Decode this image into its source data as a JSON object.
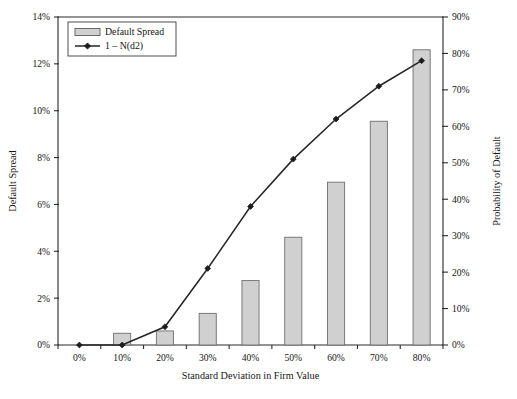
{
  "chart_data": {
    "type": "bar",
    "title": "",
    "subtitle": "",
    "xlabel": "Standard Deviation in Firm Value",
    "ylabel": "Default Spread",
    "y2label": "Probability of Default",
    "categories": [
      "0%",
      "10%",
      "20%",
      "30%",
      "40%",
      "50%",
      "60%",
      "70%",
      "80%"
    ],
    "x_tick_labels": [
      "0%",
      "10%",
      "20%",
      "30%",
      "40%",
      "50%",
      "60%",
      "70%",
      "80%"
    ],
    "y_tick_labels": [
      "0%",
      "2%",
      "4%",
      "6%",
      "8%",
      "10%",
      "12%",
      "14%"
    ],
    "y2_tick_labels": [
      "0%",
      "10%",
      "20%",
      "30%",
      "40%",
      "50%",
      "60%",
      "70%",
      "80%",
      "90%"
    ],
    "ylim": [
      0,
      14
    ],
    "y2lim": [
      0,
      90
    ],
    "grid": false,
    "legend_position": "top-left",
    "series": [
      {
        "name": "Default Spread",
        "type": "bar",
        "axis": "left",
        "values": [
          0,
          0.5,
          0.6,
          1.35,
          2.75,
          4.6,
          6.95,
          9.55,
          12.6
        ]
      },
      {
        "name": "1 – N(d2)",
        "type": "line",
        "axis": "right",
        "values": [
          0,
          0,
          5,
          21,
          38,
          51,
          62,
          71,
          78
        ]
      }
    ],
    "legend": [
      {
        "label": "Default Spread",
        "marker": "filled-rect-swatch"
      },
      {
        "label": "1 – N(d2)",
        "marker": "line-with-diamond"
      }
    ],
    "colors": {
      "bar_fill": "#d0d0d0",
      "bar_stroke": "#6e6e6e",
      "line": "#252525",
      "axis": "#2b2b2b",
      "background": "#ffffff"
    }
  }
}
